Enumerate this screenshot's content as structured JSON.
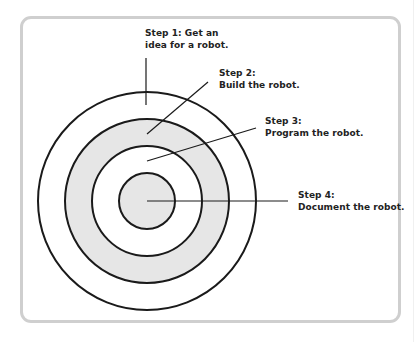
{
  "diagram": {
    "type": "concentric-circles",
    "center": {
      "x": 147,
      "y": 201
    },
    "rings": [
      {
        "radius": 109,
        "fill": "#ffffff"
      },
      {
        "radius": 82,
        "fill": "#e6e6e6"
      },
      {
        "radius": 55,
        "fill": "#ffffff"
      },
      {
        "radius": 28,
        "fill": "#e6e6e6"
      }
    ],
    "stroke_color": "#1a1a1a",
    "frame_border_color": "#cfcfcf"
  },
  "steps": [
    {
      "line1": "Step 1: Get an",
      "line2": "idea for a robot."
    },
    {
      "line1": "Step 2:",
      "line2": "Build the robot."
    },
    {
      "line1": "Step 3:",
      "line2": "Program the robot."
    },
    {
      "line1": "Step 4:",
      "line2": "Document the robot."
    }
  ]
}
